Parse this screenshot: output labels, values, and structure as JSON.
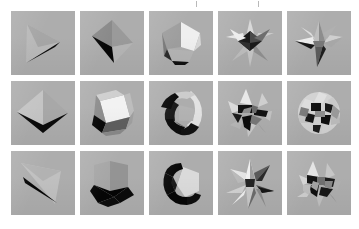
{
  "figure": {
    "background_color": "#ffffff",
    "panel_color": "#adadad",
    "rows": 3,
    "columns": 5,
    "panel_size_px": 64,
    "tick_marks": {
      "count": 2,
      "color": "#b9b9b9",
      "positions_px": [
        196,
        258
      ]
    }
  },
  "panels": [
    {
      "index": 1,
      "row": 1,
      "column": 1,
      "label": "tetrahedron-flat",
      "description": "Large light-gray triangular face with a thin black curved sliver along the lower right edge",
      "face_colors": [
        "#b9b9b9",
        "#a2a2a2",
        "#0d0d0d"
      ],
      "complexity": "low"
    },
    {
      "index": 2,
      "row": 1,
      "column": 2,
      "label": "tetrahedron-dark-face",
      "description": "Four-sided wedge with a large solid black face on the lower left and mid-gray faces to the right",
      "face_colors": [
        "#8f8f8f",
        "#070707",
        "#b5b5b5",
        "#9a9a9a"
      ],
      "complexity": "low"
    },
    {
      "index": 3,
      "row": 1,
      "column": 3,
      "label": "icosahedron",
      "description": "Rounded many-faced polyhedron with bright white upper-right facets, mid-gray left facets and a black facet at the bottom",
      "face_colors": [
        "#efefef",
        "#d8d8d8",
        "#9e9e9e",
        "#7a7a7a",
        "#101010"
      ],
      "complexity": "medium"
    },
    {
      "index": 4,
      "row": 1,
      "column": 4,
      "label": "small-stellated-polyhedron",
      "description": "Spiky star-shaped stellation with many thin light and dark spikes radiating outward",
      "face_colors": [
        "#e6e6e6",
        "#c2c2c2",
        "#6e6e6e",
        "#1a1a1a"
      ],
      "complexity": "high"
    },
    {
      "index": 5,
      "row": 1,
      "column": 5,
      "label": "great-stellated-polyhedron",
      "description": "Four-pointed star stellation with broad pale facets and deep black shadowed wedges",
      "face_colors": [
        "#ededed",
        "#b0b0b0",
        "#5c5c5c",
        "#141414"
      ],
      "complexity": "high"
    },
    {
      "index": 6,
      "row": 2,
      "column": 1,
      "label": "square-bipyramid",
      "description": "Octahedron seen edge-on: two large smooth gray triangular faces meeting at a vertical ridge with a black V-shaped notch underneath",
      "face_colors": [
        "#c4c4c4",
        "#a8a8a8",
        "#0b0b0b"
      ],
      "complexity": "low"
    },
    {
      "index": 7,
      "row": 2,
      "column": 2,
      "label": "cuboctahedron",
      "description": "Cuboctahedron with a bright white square face toward the viewer, pale gray upper facets and black facets below",
      "face_colors": [
        "#f2f2f2",
        "#cfcfcf",
        "#8d8d8d",
        "#090909"
      ],
      "complexity": "medium"
    },
    {
      "index": 8,
      "row": 2,
      "column": 3,
      "label": "crescent-toroid",
      "description": "C-shaped crescent solid, pale on the inner right side with a thick black band wrapping the outer left and bottom",
      "face_colors": [
        "#e2e2e2",
        "#bdbdbd",
        "#8a8a8a",
        "#0a0a0a"
      ],
      "complexity": "medium"
    },
    {
      "index": 9,
      "row": 2,
      "column": 4,
      "label": "compound-stellation-spiky",
      "description": "Dense cluster of irregular pale shards with heavy black crevices between them",
      "face_colors": [
        "#e8e8e8",
        "#b6b6b6",
        "#6a6a6a",
        "#101010"
      ],
      "complexity": "very-high"
    },
    {
      "index": 10,
      "row": 2,
      "column": 5,
      "label": "stellated-sphere-cluster",
      "description": "Near-spherical cluster of many small pale facets with dark cracks forming a ball-like stellation",
      "face_colors": [
        "#e0e0e0",
        "#bcbcbc",
        "#787878",
        "#121212"
      ],
      "complexity": "very-high"
    },
    {
      "index": 11,
      "row": 3,
      "column": 1,
      "label": "degenerate-triangle",
      "description": "Very flat pale triangle with a long black crescent sliver across the middle",
      "face_colors": [
        "#c0c0c0",
        "#b2b2b2",
        "#060606"
      ],
      "complexity": "low"
    },
    {
      "index": 12,
      "row": 3,
      "column": 2,
      "label": "cube-corner",
      "description": "Cube viewed at a corner: mid-gray upper faces and a large solid black face at the bottom",
      "face_colors": [
        "#a6a6a6",
        "#949494",
        "#c6c6c6",
        "#050505"
      ],
      "complexity": "low"
    },
    {
      "index": 13,
      "row": 3,
      "column": 3,
      "label": "hooked-crescent",
      "description": "Hook-shaped solid with a pale pentagonal facet on the right and a thick black arm curving down and left",
      "face_colors": [
        "#dadada",
        "#b4b4b4",
        "#070707"
      ],
      "complexity": "medium"
    },
    {
      "index": 14,
      "row": 3,
      "column": 4,
      "label": "eight-point-star-stellation",
      "description": "Eight-pointed star stellation with alternating white and dark gray triangular spikes",
      "face_colors": [
        "#f0f0f0",
        "#c8c8c8",
        "#636363",
        "#161616"
      ],
      "complexity": "high"
    },
    {
      "index": 15,
      "row": 3,
      "column": 5,
      "label": "multi-spike-stellation",
      "description": "Irregular stellation with many sharp pale spikes and dark recessed valleys",
      "face_colors": [
        "#e4e4e4",
        "#b8b8b8",
        "#707070",
        "#131313"
      ],
      "complexity": "very-high"
    }
  ]
}
